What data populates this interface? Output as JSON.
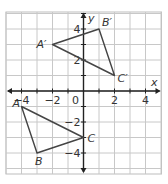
{
  "figure": {
    "type": "coordinate-grid-transformation",
    "axes": {
      "x_label": "x",
      "y_label": "y",
      "x_range": [
        -5,
        5
      ],
      "y_range": [
        -5.35,
        5.1
      ],
      "x_tick_labels": [
        {
          "value": -4,
          "text": "−4"
        },
        {
          "value": -2,
          "text": "−2"
        },
        {
          "value": 0,
          "text": "0"
        },
        {
          "value": 2,
          "text": "2"
        },
        {
          "value": 4,
          "text": "4"
        }
      ],
      "y_tick_labels": [
        {
          "value": 4,
          "text": "4"
        },
        {
          "value": 2,
          "text": "2"
        },
        {
          "value": -2,
          "text": "−2"
        },
        {
          "value": -4,
          "text": "−4"
        }
      ],
      "grid": true
    },
    "triangles": [
      {
        "name": "ABC",
        "vertices": [
          {
            "label": "A",
            "x": -4,
            "y": -1
          },
          {
            "label": "B",
            "x": -3,
            "y": -4
          },
          {
            "label": "C",
            "x": 0,
            "y": -3
          }
        ]
      },
      {
        "name": "A'B'C'",
        "vertices": [
          {
            "label": "A′",
            "x": -2,
            "y": 3
          },
          {
            "label": "B′",
            "x": 1,
            "y": 4
          },
          {
            "label": "C′",
            "x": 2,
            "y": 1
          }
        ]
      }
    ],
    "colors": {
      "grid": "#c8c8c8",
      "axis": "#222222",
      "triangle": "#444444",
      "text": "#333333",
      "frame": "#bdbdbd"
    }
  }
}
